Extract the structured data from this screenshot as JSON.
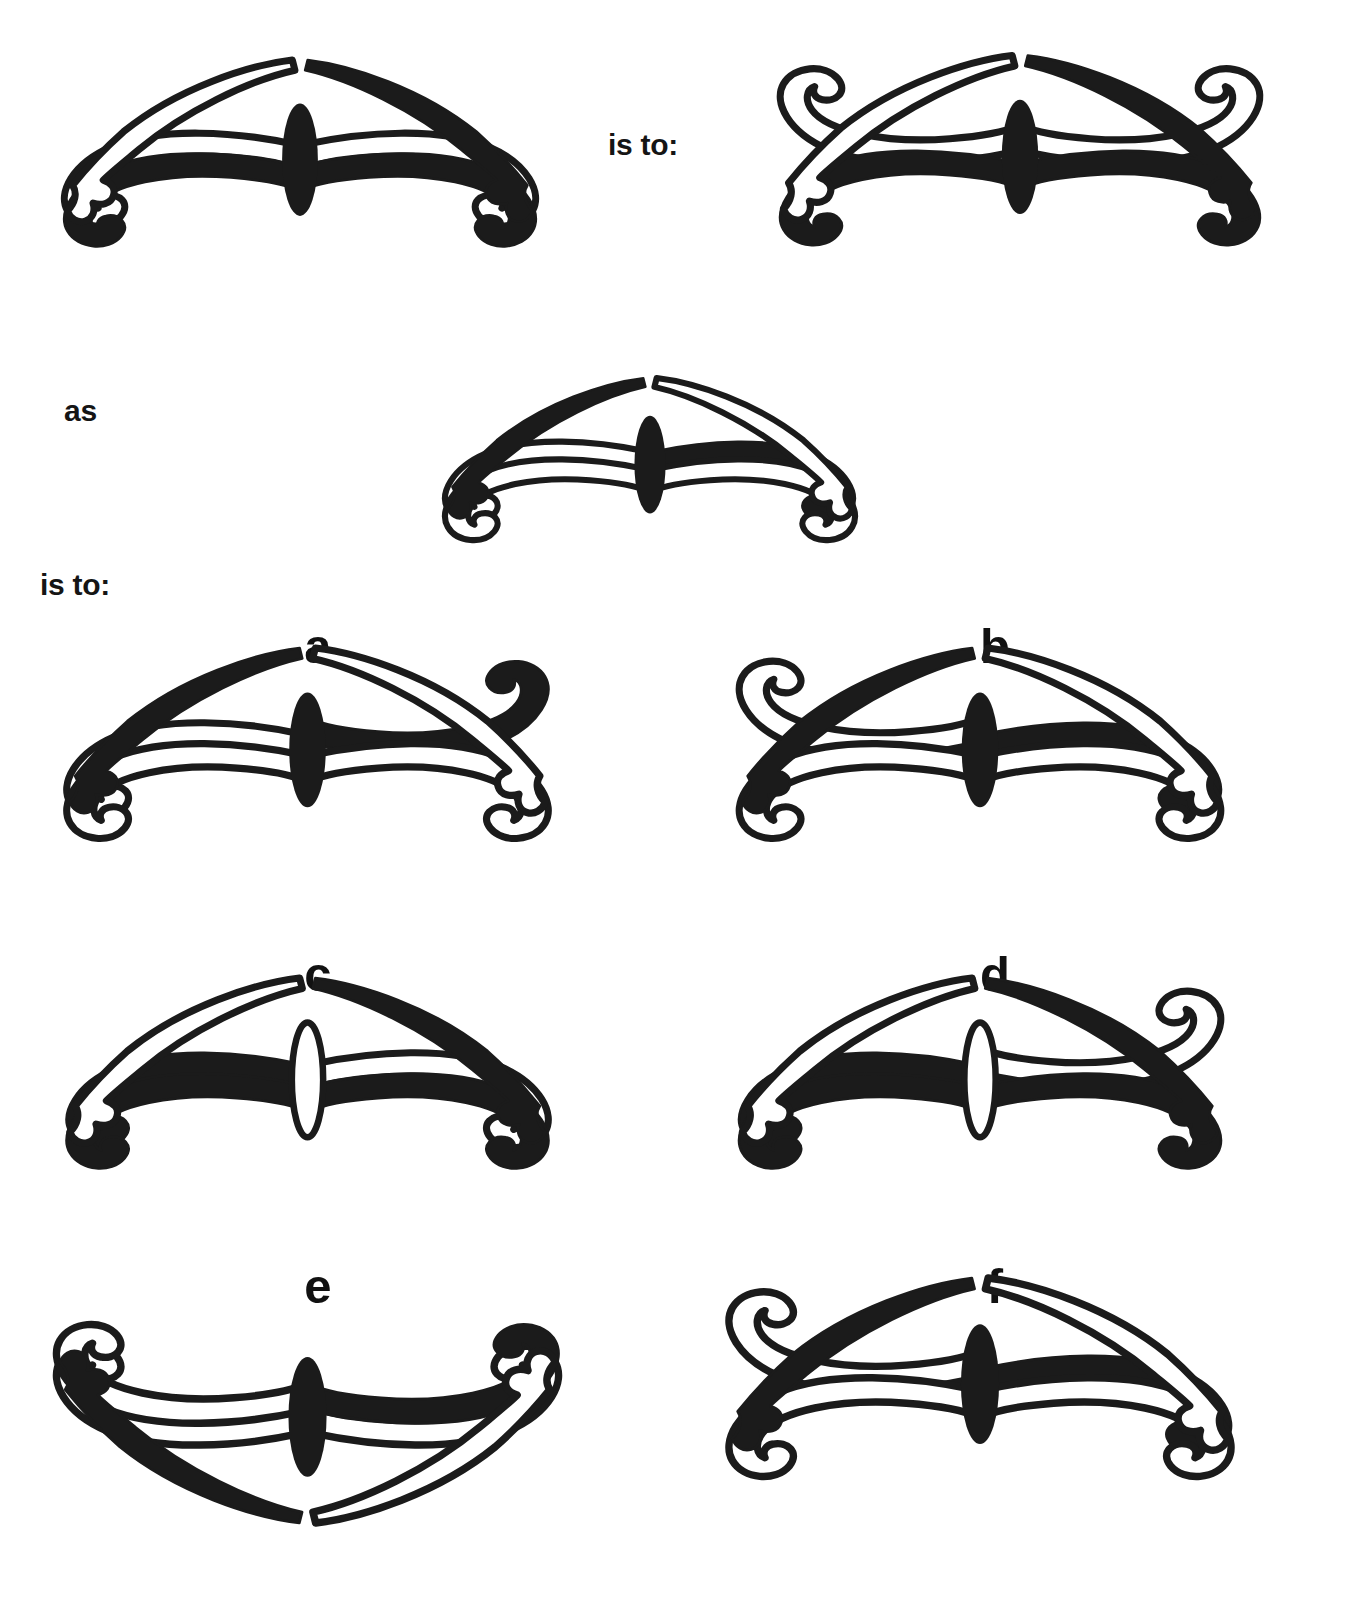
{
  "puzzle": {
    "type": "visual-analogy",
    "kind": "butterfly-ornament",
    "connectors": [
      {
        "id": "is-to-1",
        "text": "is to:",
        "x": 608,
        "y": 128
      },
      {
        "id": "as",
        "text": "as",
        "x": 64,
        "y": 394
      },
      {
        "id": "is-to-2",
        "text": "is to:",
        "x": 40,
        "y": 568
      }
    ],
    "stem": {
      "figures": [
        {
          "id": "stem-a",
          "role": "analogy-term-1",
          "x": 40,
          "y": 60,
          "w": 520,
          "h": 230,
          "body": "filled",
          "body_note": "solid dark vertical ellipse at center",
          "wings": {
            "upper_left": {
              "fill": "hollow",
              "hook": "down-inner"
            },
            "upper_right": {
              "fill": "hollow",
              "hook": "down-inner"
            },
            "lower_left": {
              "fill": "filled",
              "hook": "up-outer"
            },
            "lower_right": {
              "fill": "filled",
              "hook": "up-outer"
            }
          },
          "tails": {
            "left": {
              "fill": "filled"
            },
            "right": {
              "fill": "hollow"
            }
          }
        },
        {
          "id": "stem-b",
          "role": "analogy-term-2",
          "x": 760,
          "y": 55,
          "w": 520,
          "h": 235,
          "body": "filled",
          "body_note": "solid dark vertical ellipse at center",
          "wings": {
            "upper_left": {
              "fill": "hollow",
              "hook": "up-outer"
            },
            "upper_right": {
              "fill": "hollow",
              "hook": "up-outer"
            },
            "lower_left": {
              "fill": "filled",
              "hook": "up-outer"
            },
            "lower_right": {
              "fill": "filled",
              "hook": "up-outer"
            }
          },
          "tails": {
            "left": {
              "fill": "filled"
            },
            "right": {
              "fill": "hollow"
            }
          }
        },
        {
          "id": "stem-c",
          "role": "analogy-term-3",
          "x": 390,
          "y": 378,
          "w": 520,
          "h": 200,
          "body": "filled",
          "body_note": "solid dark vertical ellipse at center",
          "wings": {
            "upper_left": {
              "fill": "filled",
              "hook": "down-inner"
            },
            "upper_right": {
              "fill": "hollow",
              "hook": "down-inner"
            },
            "lower_left": {
              "fill": "hollow",
              "hook": "up-outer"
            },
            "lower_right": {
              "fill": "hollow",
              "hook": "up-outer"
            }
          },
          "tails": {
            "left": {
              "fill": "hollow"
            },
            "right": {
              "fill": "filled"
            }
          }
        }
      ]
    },
    "options": [
      {
        "id": "option-a",
        "letter": "a",
        "letter_x": 318,
        "letter_y": 622,
        "x": 35,
        "y": 648,
        "w": 545,
        "h": 235,
        "body": "filled",
        "wings": {
          "upper_left": {
            "fill": "filled",
            "hook": "up-outer"
          },
          "upper_right": {
            "fill": "hollow",
            "hook": "down-inner"
          },
          "lower_left": {
            "fill": "hollow",
            "hook": "up-outer"
          },
          "lower_right": {
            "fill": "hollow",
            "hook": "up-outer"
          }
        },
        "tails": {
          "left": {
            "fill": "hollow"
          },
          "right": {
            "fill": "filled"
          }
        }
      },
      {
        "id": "option-b",
        "letter": "b",
        "letter_x": 995,
        "letter_y": 622,
        "x": 700,
        "y": 648,
        "w": 560,
        "h": 235,
        "body": "filled",
        "wings": {
          "upper_left": {
            "fill": "filled",
            "hook": "down-inner"
          },
          "upper_right": {
            "fill": "hollow",
            "hook": "up-outer"
          },
          "lower_left": {
            "fill": "hollow",
            "hook": "up-outer"
          },
          "lower_right": {
            "fill": "hollow",
            "hook": "up-outer"
          }
        },
        "tails": {
          "left": {
            "fill": "hollow"
          },
          "right": {
            "fill": "filled"
          }
        }
      },
      {
        "id": "option-c",
        "letter": "c",
        "letter_x": 318,
        "letter_y": 950,
        "x": 35,
        "y": 978,
        "w": 545,
        "h": 235,
        "body": "hollow",
        "body_note": "outlined white vertical ellipse at center",
        "wings": {
          "upper_left": {
            "fill": "hollow",
            "hook": "down-inner"
          },
          "upper_right": {
            "fill": "filled",
            "hook": "down-inner"
          },
          "lower_left": {
            "fill": "filled",
            "hook": "up-outer"
          },
          "lower_right": {
            "fill": "filled",
            "hook": "up-outer"
          }
        },
        "tails": {
          "left": {
            "fill": "filled"
          },
          "right": {
            "fill": "hollow"
          }
        }
      },
      {
        "id": "option-d",
        "letter": "d",
        "letter_x": 995,
        "letter_y": 950,
        "x": 700,
        "y": 978,
        "w": 560,
        "h": 235,
        "body": "hollow",
        "body_note": "outlined white vertical ellipse at center",
        "wings": {
          "upper_left": {
            "fill": "hollow",
            "hook": "up-outer"
          },
          "upper_right": {
            "fill": "filled",
            "hook": "down-inner"
          },
          "lower_left": {
            "fill": "filled",
            "hook": "up-outer"
          },
          "lower_right": {
            "fill": "filled",
            "hook": "up-outer"
          }
        },
        "tails": {
          "left": {
            "fill": "filled"
          },
          "right": {
            "fill": "hollow"
          }
        }
      },
      {
        "id": "option-e",
        "letter": "e",
        "letter_x": 318,
        "letter_y": 1262,
        "x": 35,
        "y": 1278,
        "w": 545,
        "h": 245,
        "body": "filled",
        "flip": "vertical",
        "wings": {
          "upper_left": {
            "fill": "hollow",
            "hook": "down-inner"
          },
          "upper_right": {
            "fill": "hollow",
            "hook": "down-inner"
          },
          "lower_left": {
            "fill": "filled",
            "hook": "up-outer"
          },
          "lower_right": {
            "fill": "hollow",
            "hook": "up-outer"
          }
        },
        "tails": {
          "left": {
            "fill": "hollow"
          },
          "right": {
            "fill": "filled"
          }
        }
      },
      {
        "id": "option-f",
        "letter": "f",
        "letter_x": 995,
        "letter_y": 1262,
        "x": 700,
        "y": 1278,
        "w": 560,
        "h": 245,
        "body": "filled",
        "wings": {
          "upper_left": {
            "fill": "filled",
            "hook": "down-inner"
          },
          "upper_right": {
            "fill": "hollow",
            "hook": "up-outer"
          },
          "lower_left": {
            "fill": "hollow",
            "hook": "up-outer"
          },
          "lower_right": {
            "fill": "hollow",
            "hook": "up-outer"
          }
        },
        "tails": {
          "left": {
            "fill": "hollow"
          },
          "right": {
            "fill": "filled"
          }
        }
      }
    ],
    "colors": {
      "ink": "#1b1b1b",
      "paper": "#ffffff"
    }
  }
}
